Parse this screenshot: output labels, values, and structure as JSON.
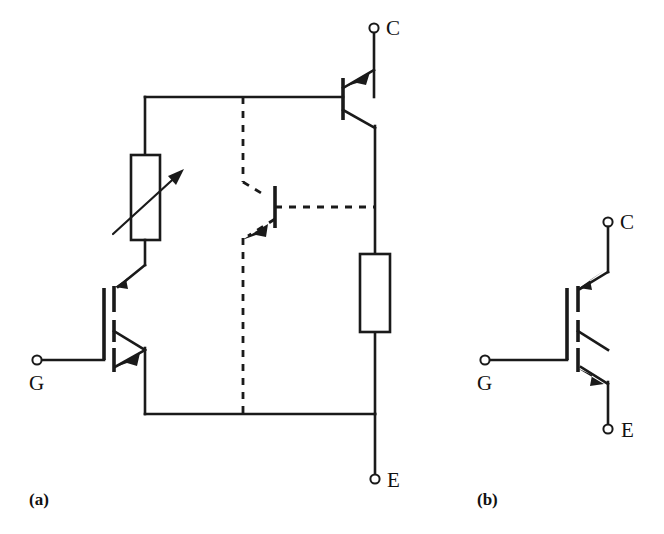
{
  "figure": {
    "background_color": "#ffffff",
    "line_color": "#1a1a1a",
    "panels": [
      {
        "id": "a",
        "caption": "(a)",
        "description": "IGBT equivalent circuit model",
        "terminals": [
          {
            "name": "collector",
            "label": "C"
          },
          {
            "name": "gate",
            "label": "G"
          },
          {
            "name": "emitter",
            "label": "E"
          }
        ],
        "components": [
          {
            "name": "variable-resistor",
            "type": "variable-resistor"
          },
          {
            "name": "resistor",
            "type": "resistor"
          },
          {
            "name": "pnp-transistor",
            "type": "bjt-pnp",
            "style": "solid"
          },
          {
            "name": "npn-transistor",
            "type": "bjt-npn",
            "style": "dashed"
          },
          {
            "name": "mosfet",
            "type": "n-channel-mosfet",
            "style": "solid"
          }
        ]
      },
      {
        "id": "b",
        "caption": "(b)",
        "description": "IGBT circuit symbol",
        "terminals": [
          {
            "name": "collector",
            "label": "C"
          },
          {
            "name": "gate",
            "label": "G"
          },
          {
            "name": "emitter",
            "label": "E"
          }
        ],
        "components": [
          {
            "name": "igbt-symbol",
            "type": "igbt"
          }
        ]
      }
    ]
  },
  "labels": {
    "a_collector": "C",
    "a_gate": "G",
    "a_emitter": "E",
    "a_caption": "(a)",
    "b_collector": "C",
    "b_gate": "G",
    "b_emitter": "E",
    "b_caption": "(b)"
  }
}
